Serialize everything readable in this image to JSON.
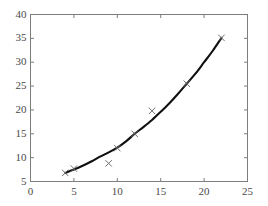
{
  "chart_data": {
    "type": "scatter",
    "title": "",
    "subtitle": "",
    "xlabel": "",
    "ylabel": "",
    "xlim": [
      0,
      25
    ],
    "ylim": [
      5,
      40
    ],
    "xticks": [
      0,
      5,
      10,
      15,
      20,
      25
    ],
    "yticks": [
      5,
      10,
      15,
      20,
      25,
      30,
      35,
      40
    ],
    "xtick_labels": [
      "0",
      "5",
      "10",
      "15",
      "20",
      "25"
    ],
    "ytick_labels": [
      "5",
      "10",
      "15",
      "20",
      "25",
      "30",
      "35",
      "40"
    ],
    "grid": false,
    "legend": null,
    "legend_position": "none",
    "frame": true,
    "annotations": [],
    "series": [
      {
        "name": "data points",
        "type": "scatter",
        "marker": "x",
        "color": "#6e6e6e",
        "points": [
          {
            "x": 4.0,
            "y": 6.8
          },
          {
            "x": 5.0,
            "y": 7.7
          },
          {
            "x": 9.0,
            "y": 8.8
          },
          {
            "x": 10.0,
            "y": 12.0
          },
          {
            "x": 12.0,
            "y": 15.0
          },
          {
            "x": 14.0,
            "y": 19.8
          },
          {
            "x": 18.0,
            "y": 25.5
          },
          {
            "x": 22.0,
            "y": 35.1
          }
        ]
      },
      {
        "name": "fitted curve",
        "type": "line",
        "color": "#101010",
        "points": [
          {
            "x": 4.0,
            "y": 6.8
          },
          {
            "x": 5.0,
            "y": 7.5
          },
          {
            "x": 6.0,
            "y": 8.3
          },
          {
            "x": 7.0,
            "y": 9.2
          },
          {
            "x": 8.0,
            "y": 10.2
          },
          {
            "x": 9.0,
            "y": 11.1
          },
          {
            "x": 10.0,
            "y": 12.1
          },
          {
            "x": 11.0,
            "y": 13.4
          },
          {
            "x": 12.0,
            "y": 15.0
          },
          {
            "x": 13.0,
            "y": 16.4
          },
          {
            "x": 14.0,
            "y": 17.9
          },
          {
            "x": 15.0,
            "y": 19.6
          },
          {
            "x": 16.0,
            "y": 21.4
          },
          {
            "x": 17.0,
            "y": 23.4
          },
          {
            "x": 18.0,
            "y": 25.5
          },
          {
            "x": 19.0,
            "y": 27.6
          },
          {
            "x": 20.0,
            "y": 30.0
          },
          {
            "x": 21.0,
            "y": 32.4
          },
          {
            "x": 22.0,
            "y": 35.1
          }
        ]
      }
    ]
  },
  "axis_color": "#7d7d7d",
  "tick_color": "#4a4a4a",
  "background_color": "#ffffff"
}
